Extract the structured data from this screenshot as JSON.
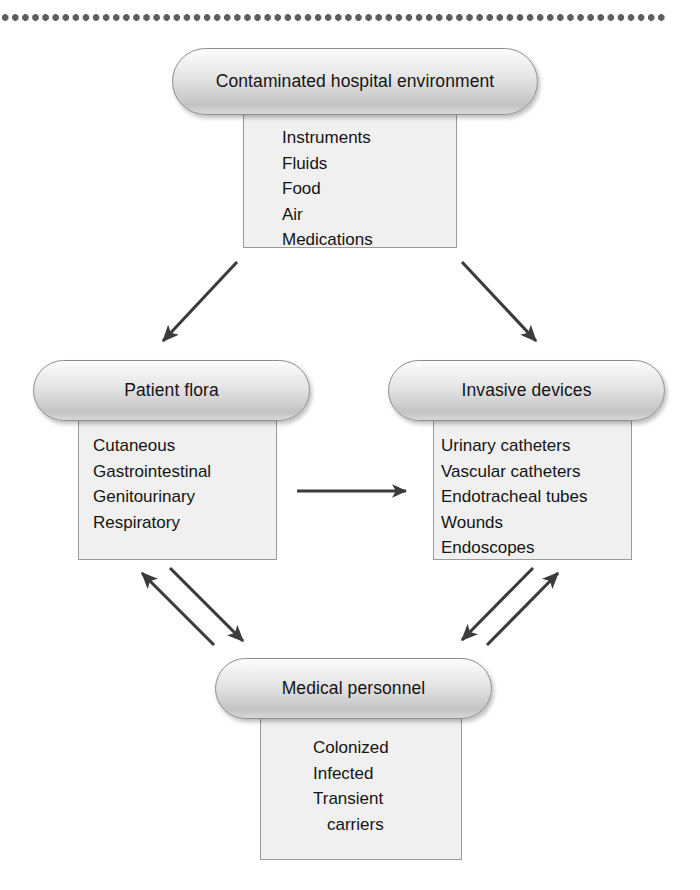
{
  "diagram": {
    "type": "flow-diagram",
    "divider": {
      "name": "dotted-rule",
      "color": "#5d5d62",
      "dot_count": 66
    },
    "colors": {
      "pill_border": "#8d8d90",
      "pill_fill_top": "#fdfdfd",
      "pill_fill_bottom": "#c3c3c3",
      "box_border": "#9a9a9a",
      "box_fill": "#f0f0f0",
      "arrow": "#3b3b3b",
      "text": "#141414"
    },
    "nodes": [
      {
        "id": "environment",
        "title": "Contaminated hospital environment",
        "items": [
          "Instruments",
          "Fluids",
          "Food",
          "Air",
          "Medications"
        ]
      },
      {
        "id": "patient-flora",
        "title": "Patient flora",
        "items": [
          "Cutaneous",
          "Gastrointestinal",
          "Genitourinary",
          "Respiratory"
        ]
      },
      {
        "id": "invasive-devices",
        "title": "Invasive devices",
        "items": [
          "Urinary catheters",
          "Vascular catheters",
          "Endotracheal tubes",
          "Wounds",
          "Endoscopes"
        ]
      },
      {
        "id": "medical-personnel",
        "title": "Medical personnel",
        "items": [
          "Colonized",
          "Infected",
          "Transient",
          "carriers"
        ]
      }
    ],
    "arrows": [
      {
        "id": "environment-to-patient-flora",
        "from": "environment",
        "to": "patient-flora",
        "direction": "one-way"
      },
      {
        "id": "environment-to-invasive-devices",
        "from": "environment",
        "to": "invasive-devices",
        "direction": "one-way"
      },
      {
        "id": "patient-flora-to-invasive-devices",
        "from": "patient-flora",
        "to": "invasive-devices",
        "direction": "one-way"
      },
      {
        "id": "medical-personnel-to-patient-flora",
        "from": "medical-personnel",
        "to": "patient-flora",
        "direction": "one-way"
      },
      {
        "id": "patient-flora-to-medical-personnel",
        "from": "patient-flora",
        "to": "medical-personnel",
        "direction": "one-way"
      },
      {
        "id": "medical-personnel-to-invasive-devices",
        "from": "medical-personnel",
        "to": "invasive-devices",
        "direction": "one-way"
      },
      {
        "id": "invasive-devices-to-medical-personnel",
        "from": "invasive-devices",
        "to": "medical-personnel",
        "direction": "one-way"
      }
    ]
  }
}
